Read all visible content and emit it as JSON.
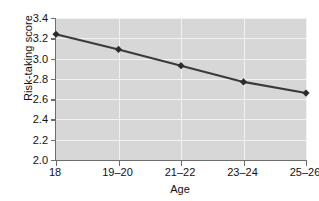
{
  "chart_data": {
    "type": "line",
    "title": "",
    "xlabel": "Age",
    "ylabel": "Risk-taking score",
    "categories": [
      "18",
      "19–20",
      "21–22",
      "23–24",
      "25–26"
    ],
    "values": [
      3.24,
      3.09,
      2.93,
      2.77,
      2.66
    ],
    "series": [
      {
        "name": "Risk-taking score",
        "values": [
          3.24,
          3.09,
          2.93,
          2.77,
          2.66
        ]
      }
    ],
    "ylim": [
      2.0,
      3.4
    ],
    "ytick_labels": [
      "2.0",
      "2.2",
      "2.4",
      "2.6",
      "2.8",
      "3.0",
      "3.2",
      "3.4"
    ],
    "ytick_values": [
      2.0,
      2.2,
      2.4,
      2.6,
      2.8,
      3.0,
      3.2,
      3.4
    ],
    "grid": true,
    "grid_color": "#f2f2f2",
    "plot_background": "#d7d7d7",
    "line_color": "#3a3a3a",
    "marker_color": "#2b2b2b",
    "marker": "diamond",
    "axis_color": "#6d6d6d",
    "legend": false,
    "legend_position": "none"
  }
}
